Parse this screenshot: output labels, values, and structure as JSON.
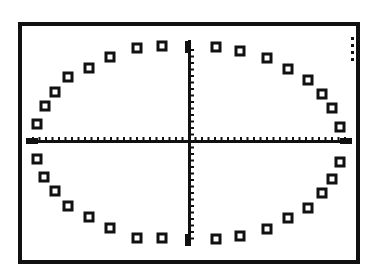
{
  "colors": {
    "background": "#ffffff",
    "ink": "#111111"
  },
  "screen": {
    "frame": {
      "x": 20,
      "y": 24,
      "w": 338,
      "h": 238,
      "stroke": 4
    },
    "axes": {
      "origin_x": 189,
      "origin_y": 141
    },
    "busy_indicator": {
      "x": 351,
      "y": 37,
      "dots": 4,
      "spacing": 7
    }
  },
  "chart_data": {
    "type": "scatter",
    "title": "",
    "xlabel": "",
    "ylabel": "",
    "grid": false,
    "legend": null,
    "marker": "hollow-square",
    "series": [
      {
        "name": "ellipse",
        "points_px": [
          [
            162,
            46
          ],
          [
            137,
            48
          ],
          [
            110,
            57
          ],
          [
            89,
            68
          ],
          [
            68,
            77
          ],
          [
            55,
            92
          ],
          [
            45,
            106
          ],
          [
            37,
            124
          ],
          [
            37,
            159
          ],
          [
            44,
            177
          ],
          [
            55,
            191
          ],
          [
            68,
            206
          ],
          [
            89,
            217
          ],
          [
            110,
            228
          ],
          [
            137,
            238
          ],
          [
            162,
            238
          ],
          [
            216,
            239
          ],
          [
            240,
            236
          ],
          [
            267,
            229
          ],
          [
            288,
            218
          ],
          [
            308,
            208
          ],
          [
            322,
            193
          ],
          [
            332,
            179
          ],
          [
            340,
            162
          ],
          [
            340,
            127
          ],
          [
            332,
            108
          ],
          [
            322,
            94
          ],
          [
            308,
            80
          ],
          [
            288,
            69
          ],
          [
            267,
            58
          ],
          [
            240,
            51
          ],
          [
            216,
            47
          ]
        ]
      }
    ],
    "axis_ticks": {
      "x_spacing_px": 6.5,
      "y_spacing_px": 6.5
    }
  }
}
